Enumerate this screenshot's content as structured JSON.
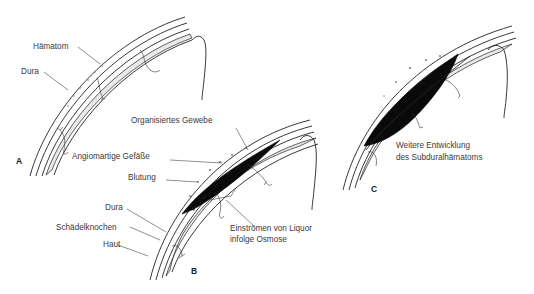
{
  "figure": {
    "panels": [
      {
        "id": "A",
        "label": "A",
        "annotations": [
          {
            "key": "haematom",
            "text": "Hämatom"
          },
          {
            "key": "dura",
            "text": "Dura"
          }
        ]
      },
      {
        "id": "B",
        "label": "B",
        "annotations": [
          {
            "key": "organisiertes_gewebe",
            "text": "Organisiertes Gewebe"
          },
          {
            "key": "angiomartige_gefaesse",
            "text": "Angiomartige Gefäße"
          },
          {
            "key": "blutung",
            "text": "Blutung"
          },
          {
            "key": "dura",
            "text": "Dura"
          },
          {
            "key": "schaedelknochen",
            "text": "Schädelknochen"
          },
          {
            "key": "haut",
            "text": "Haut"
          },
          {
            "key": "liquor_line1",
            "text": "Einströmen von Liquor"
          },
          {
            "key": "liquor_line2",
            "text": "infolge Osmose"
          }
        ]
      },
      {
        "id": "C",
        "label": "C",
        "annotations": [
          {
            "key": "caption_line1",
            "text": "Weitere Entwicklung"
          },
          {
            "key": "caption_line2",
            "text": "des Subduralhämatoms"
          }
        ]
      }
    ],
    "colors": {
      "ink": "#222222",
      "hematoma": "#0a0a0a",
      "dura_fill": "#e9e9e9",
      "text": "#3a3a3a",
      "background": "#ffffff"
    }
  }
}
